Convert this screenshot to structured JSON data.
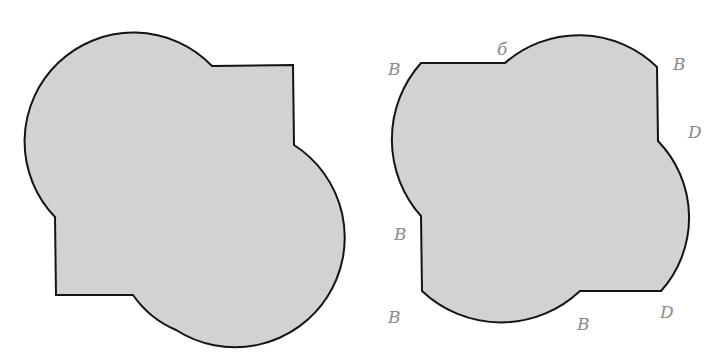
{
  "figure": {
    "colors": {
      "fill": "#d2d2d2",
      "stroke": "#141414",
      "annotation": "#8a8a8a",
      "background": "#ffffff"
    },
    "left_shape": {
      "name": "circle-square-union-left"
    },
    "right_shape": {
      "name": "circle-square-union-right",
      "labels": [
        {
          "text": "B",
          "x": 388,
          "y": 75
        },
        {
          "text": "б",
          "x": 497,
          "y": 55
        },
        {
          "text": "B",
          "x": 673,
          "y": 70
        },
        {
          "text": "D",
          "x": 688,
          "y": 138
        },
        {
          "text": "B",
          "x": 394,
          "y": 240
        },
        {
          "text": "B",
          "x": 388,
          "y": 323
        },
        {
          "text": "B",
          "x": 577,
          "y": 330
        },
        {
          "text": "D",
          "x": 660,
          "y": 318
        }
      ]
    }
  }
}
